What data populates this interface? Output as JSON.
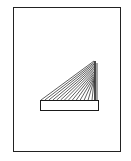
{
  "diagram": {
    "frame": {
      "stroke": "#222222",
      "fill": "#ffffff"
    },
    "bridge": {
      "stroke": "#1a1a1a",
      "deck": {
        "x": 40,
        "y": 100,
        "width": 59,
        "height": 10
      },
      "tower": {
        "x": 94,
        "top": 61,
        "bottom": 100
      },
      "cable_count": 14
    }
  }
}
